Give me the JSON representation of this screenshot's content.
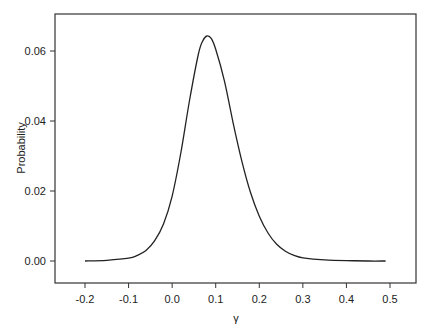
{
  "chart_data": {
    "type": "line",
    "title": "",
    "xlabel": "γ",
    "ylabel": "Probability",
    "xlim": [
      -0.25,
      0.55
    ],
    "ylim": [
      -0.0065,
      0.0715
    ],
    "grid": false,
    "legend": null,
    "x_ticks": [
      "-0.2",
      "-0.1",
      "0.0",
      "0.1",
      "0.2",
      "0.3",
      "0.4",
      "0.5"
    ],
    "y_ticks": [
      "0.00",
      "0.02",
      "0.04",
      "0.06"
    ],
    "series": [
      {
        "name": "density",
        "x": [
          -0.2,
          -0.15,
          -0.1,
          -0.08,
          -0.06,
          -0.04,
          -0.02,
          0.0,
          0.02,
          0.04,
          0.06,
          0.07,
          0.08,
          0.09,
          0.1,
          0.12,
          0.14,
          0.16,
          0.18,
          0.2,
          0.22,
          0.24,
          0.26,
          0.28,
          0.3,
          0.35,
          0.4,
          0.45,
          0.49
        ],
        "y": [
          0.0,
          0.0002,
          0.0008,
          0.0016,
          0.003,
          0.0058,
          0.0105,
          0.0185,
          0.031,
          0.046,
          0.059,
          0.0628,
          0.0643,
          0.0635,
          0.0605,
          0.0515,
          0.0395,
          0.0285,
          0.0195,
          0.0128,
          0.008,
          0.0048,
          0.0028,
          0.0016,
          0.0009,
          0.0003,
          0.0001,
          0.0,
          0.0
        ]
      }
    ]
  }
}
